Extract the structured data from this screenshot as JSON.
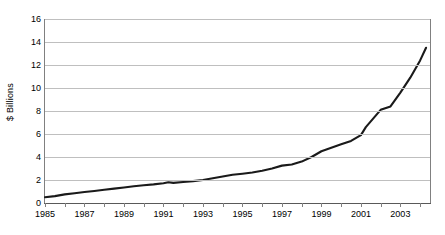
{
  "chart_data": {
    "type": "line",
    "title": "",
    "xlabel": "",
    "ylabel": "$ Billions",
    "xlim": [
      1985,
      2004.5
    ],
    "ylim": [
      0,
      16
    ],
    "ytick_values": [
      0,
      2,
      4,
      6,
      8,
      10,
      12,
      14,
      16
    ],
    "ytick_labels": [
      "0",
      "2",
      "4",
      "6",
      "8",
      "10",
      "12",
      "14",
      "16"
    ],
    "xtick_values": [
      1985,
      1986,
      1987,
      1988,
      1989,
      1990,
      1991,
      1992,
      1993,
      1994,
      1995,
      1996,
      1997,
      1998,
      1999,
      2000,
      2001,
      2002,
      2003,
      2004
    ],
    "xtick_labels": [
      "1985",
      "",
      "1987",
      "",
      "1989",
      "",
      "1991",
      "",
      "1993",
      "",
      "1995",
      "",
      "1997",
      "",
      "1999",
      "",
      "2001",
      "",
      "2003",
      ""
    ],
    "grid": "horizontal",
    "legend": "none",
    "series": [
      {
        "name": "Value",
        "color": "#1a1a1a",
        "x": [
          1985,
          1985.5,
          1986,
          1986.5,
          1987,
          1987.5,
          1988,
          1988.5,
          1989,
          1989.5,
          1990,
          1990.5,
          1991,
          1991.25,
          1991.5,
          1992,
          1992.5,
          1993,
          1993.5,
          1994,
          1994.5,
          1995,
          1995.5,
          1996,
          1996.5,
          1997,
          1997.5,
          1998,
          1998.5,
          1999,
          1999.5,
          2000,
          2000.5,
          2001,
          2001.25,
          2001.75,
          2002,
          2002.5,
          2003,
          2003.5,
          2004,
          2004.3
        ],
        "values": [
          0.5,
          0.6,
          0.75,
          0.85,
          0.95,
          1.05,
          1.15,
          1.25,
          1.35,
          1.45,
          1.55,
          1.62,
          1.72,
          1.8,
          1.75,
          1.82,
          1.9,
          2.0,
          2.15,
          2.3,
          2.45,
          2.55,
          2.65,
          2.8,
          3.0,
          3.25,
          3.35,
          3.6,
          4.0,
          4.5,
          4.8,
          5.1,
          5.4,
          5.9,
          6.6,
          7.6,
          8.1,
          8.4,
          9.6,
          10.9,
          12.4,
          13.5
        ]
      }
    ]
  }
}
